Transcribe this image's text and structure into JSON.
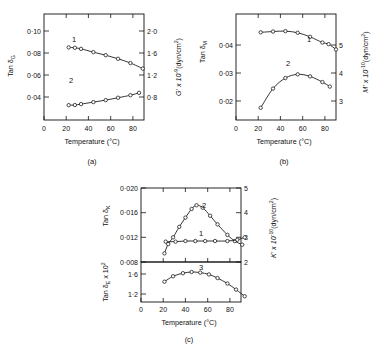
{
  "figure": {
    "panels": [
      {
        "id": "a",
        "caption": "(a)",
        "xlabel": "Temperature (°C)",
        "ylabel_left": "Tan δ",
        "ylabel_left_sub": "G",
        "ylabel_right": "G' x 10",
        "ylabel_right_exp": "-9",
        "ylabel_right_unit": "(dyn/cm",
        "ylabel_right_unit_exp": "2",
        "ylabel_right_unit_end": ")",
        "xticks": [
          "0",
          "20",
          "40",
          "60",
          "80"
        ],
        "yticks_left": [
          "0·10",
          "0·08",
          "0·06",
          "0·04"
        ],
        "yticks_right": [
          "2·0",
          "1·6",
          "1·2",
          "0·8"
        ],
        "curve_labels": [
          "1",
          "2"
        ]
      },
      {
        "id": "b",
        "caption": "(b)",
        "xlabel": "Temperature (°C)",
        "ylabel_left": "Tan δ",
        "ylabel_left_sub": "M",
        "ylabel_right": "M' x 10",
        "ylabel_right_exp": "-10",
        "ylabel_right_unit": "(dyn/cm",
        "ylabel_right_unit_exp": "2",
        "ylabel_right_unit_end": ")",
        "xticks": [
          "0",
          "20",
          "40",
          "60",
          "80"
        ],
        "yticks_left": [
          "0·04",
          "0·03",
          "0·02"
        ],
        "yticks_right": [
          "5",
          "4",
          "3"
        ],
        "curve_labels": [
          "1",
          "2"
        ]
      },
      {
        "id": "c",
        "caption": "(c)",
        "xlabel": "Temperature (°C)",
        "ylabel_left_top": "Tan δ",
        "ylabel_left_top_sub": "K",
        "ylabel_left_bot": "Tan δ",
        "ylabel_left_bot_sub": "E",
        "ylabel_left_bot_mult": " x 10",
        "ylabel_left_bot_exp": "2",
        "ylabel_right": "K' x 10",
        "ylabel_right_exp": "-10",
        "ylabel_right_unit": "(dyn/cm",
        "ylabel_right_unit_exp": "2",
        "ylabel_right_unit_end": ")",
        "xticks": [
          "0",
          "20",
          "40",
          "60",
          "80"
        ],
        "yticks_left_top": [
          "0·020",
          "0·016",
          "0·012",
          "0·008"
        ],
        "yticks_left_bot": [
          "1·6",
          "1·2"
        ],
        "yticks_right": [
          "5",
          "4",
          "3",
          "2"
        ],
        "curve_labels": [
          "2",
          "1",
          "3"
        ]
      }
    ]
  },
  "chart_data": [
    {
      "type": "line",
      "panel": "a",
      "title": "",
      "xlabel": "Temperature (°C)",
      "ylabel": "Tan δG",
      "ylabel_right": "G' x 10^-9 (dyn/cm^2)",
      "xlim": [
        0,
        90
      ],
      "ylim": [
        0.03,
        0.11
      ],
      "ylim_right": [
        0.6,
        2.2
      ],
      "xticks": [
        0,
        20,
        40,
        60,
        80
      ],
      "yticks": [
        0.04,
        0.06,
        0.08,
        0.1
      ],
      "yticks_right": [
        0.8,
        1.2,
        1.6,
        2.0
      ],
      "grid": false,
      "legend": "inline-curve-numbers",
      "series": [
        {
          "name": "1",
          "axis": "left",
          "x": [
            20,
            25,
            30,
            40,
            50,
            60,
            70,
            80
          ],
          "values": [
            0.0848,
            0.0845,
            0.0837,
            0.0812,
            0.0789,
            0.0762,
            0.073,
            0.0688
          ]
        },
        {
          "name": "2",
          "axis": "left",
          "x": [
            20,
            25,
            30,
            40,
            50,
            60,
            70,
            77
          ],
          "values": [
            0.0412,
            0.0413,
            0.042,
            0.0435,
            0.045,
            0.0468,
            0.0487,
            0.0505
          ]
        }
      ]
    },
    {
      "type": "line",
      "panel": "b",
      "title": "",
      "xlabel": "Temperature (°C)",
      "ylabel": "Tan δM",
      "ylabel_right": "M' x 10^-10 (dyn/cm^2)",
      "xlim": [
        0,
        90
      ],
      "ylim": [
        0.0185,
        0.0445
      ],
      "ylim_right": [
        2.85,
        5.45
      ],
      "xticks": [
        0,
        20,
        40,
        60,
        80
      ],
      "yticks": [
        0.02,
        0.03,
        0.04
      ],
      "yticks_right": [
        3,
        4,
        5
      ],
      "grid": false,
      "legend": "inline-curve-numbers",
      "series": [
        {
          "name": "1",
          "axis": "left",
          "x": [
            20,
            30,
            40,
            50,
            60,
            70,
            75,
            81
          ],
          "values": [
            0.04,
            0.0402,
            0.0403,
            0.0399,
            0.0389,
            0.0375,
            0.0371,
            0.0358
          ]
        },
        {
          "name": "2",
          "axis": "left",
          "x": [
            20,
            30,
            40,
            50,
            60,
            70,
            76
          ],
          "values": [
            0.0215,
            0.0262,
            0.0288,
            0.0297,
            0.0292,
            0.0278,
            0.0267
          ]
        }
      ]
    },
    {
      "type": "line",
      "panel": "c-top",
      "title": "",
      "xlabel": "Temperature (°C)",
      "ylabel": "Tan δK",
      "ylabel_right": "K' x 10^-10 (dyn/cm^2)",
      "xlim": [
        0,
        90
      ],
      "ylim": [
        0.008,
        0.02
      ],
      "ylim_right": [
        2,
        5
      ],
      "xticks": [
        0,
        20,
        40,
        60,
        80
      ],
      "yticks": [
        0.008,
        0.012,
        0.016,
        0.02
      ],
      "yticks_right": [
        2,
        3,
        4,
        5
      ],
      "grid": false,
      "legend": "inline-curve-numbers",
      "series": [
        {
          "name": "2",
          "axis": "left",
          "x": [
            19,
            22,
            26,
            31,
            36,
            41,
            45,
            50,
            56,
            62,
            70,
            76,
            82
          ],
          "values": [
            0.0094,
            0.0109,
            0.012,
            0.0137,
            0.0152,
            0.0166,
            0.0172,
            0.0168,
            0.0155,
            0.0141,
            0.0124,
            0.0114,
            0.0108
          ]
        },
        {
          "name": "1",
          "axis": "left",
          "x": [
            20,
            28,
            36,
            44,
            52,
            60,
            70,
            78,
            84
          ],
          "values": [
            0.0113,
            0.0113,
            0.0114,
            0.0114,
            0.0114,
            0.0114,
            0.0114,
            0.0116,
            0.012
          ]
        }
      ]
    },
    {
      "type": "line",
      "panel": "c-bottom",
      "title": "",
      "xlabel": "Temperature (°C)",
      "ylabel": "Tan δE x 10^2",
      "xlim": [
        0,
        90
      ],
      "ylim": [
        1.12,
        1.78
      ],
      "xticks": [
        0,
        20,
        40,
        60,
        80
      ],
      "yticks": [
        1.2,
        1.6
      ],
      "grid": false,
      "legend": "inline-curve-numbers",
      "series": [
        {
          "name": "3",
          "axis": "left",
          "x": [
            19,
            26,
            34,
            41,
            48,
            55,
            62,
            70,
            77,
            84
          ],
          "values": [
            1.455,
            1.545,
            1.595,
            1.615,
            1.605,
            1.575,
            1.515,
            1.425,
            1.325,
            1.215
          ]
        }
      ]
    }
  ]
}
